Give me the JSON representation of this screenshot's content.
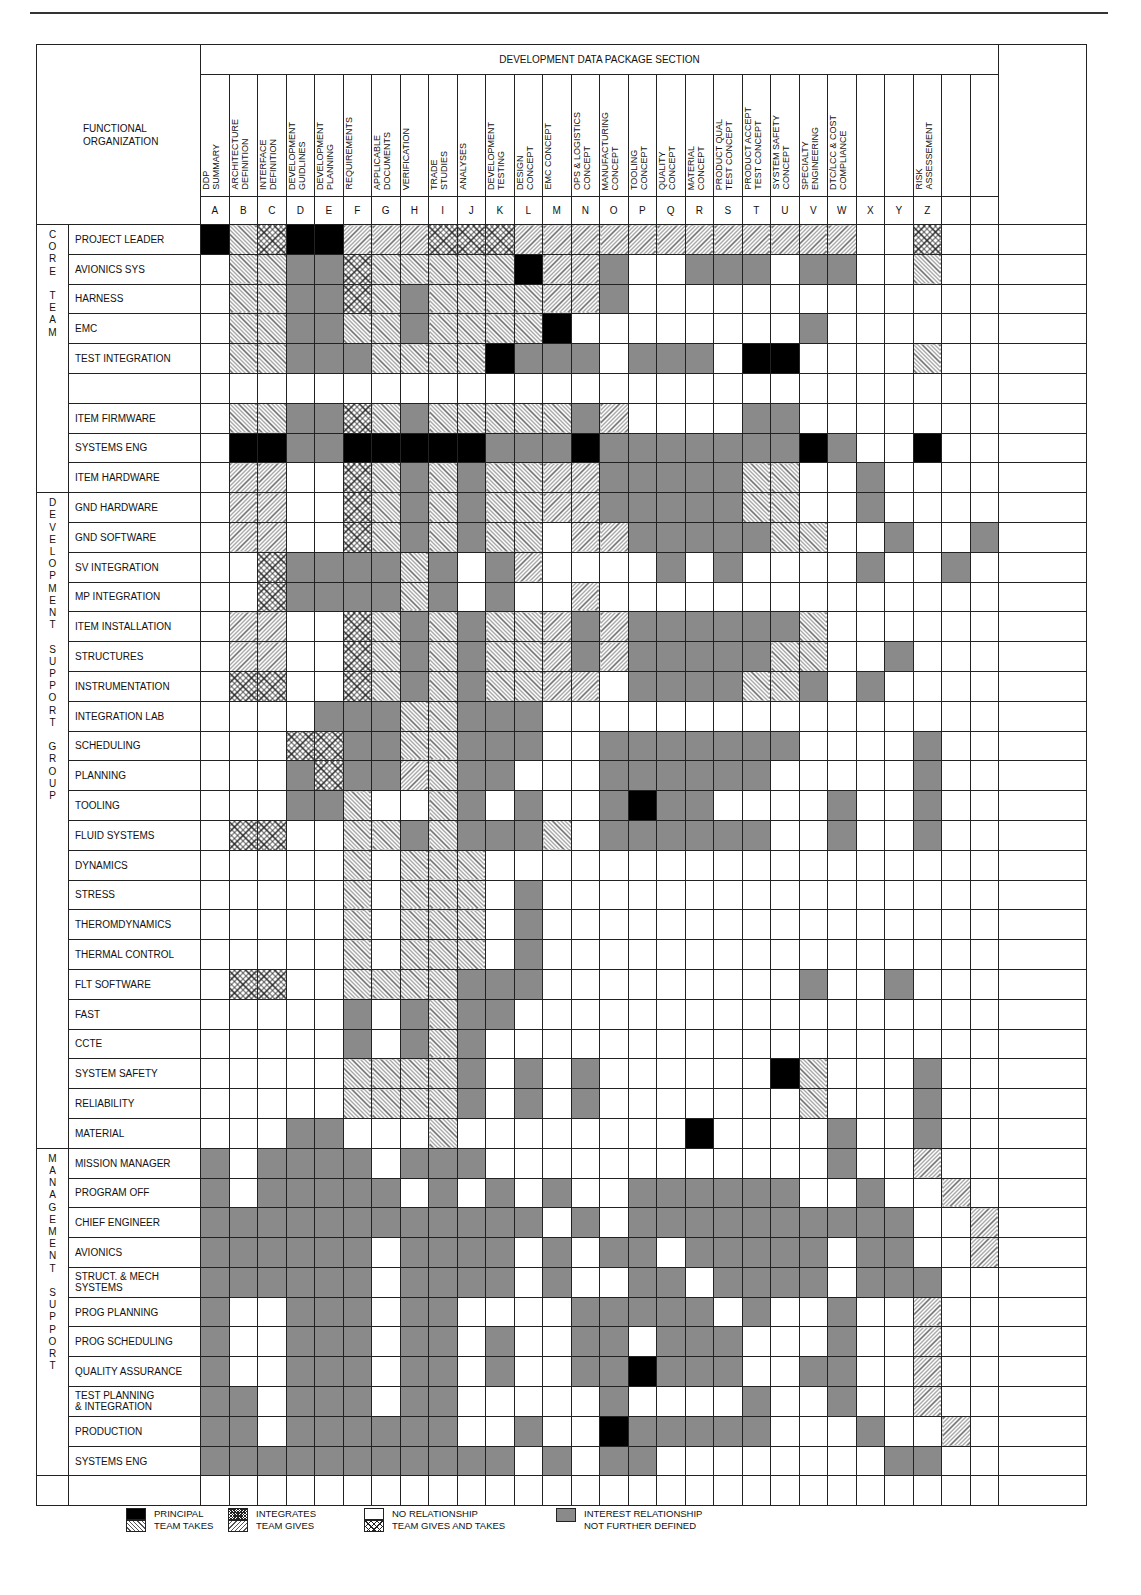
{
  "section_title": "DEVELOPMENT DATA PACKAGE SECTION",
  "functional_org_label": "FUNCTIONAL\nORGANIZATION",
  "columns": [
    {
      "letter": "A",
      "label": "DDP\nSUMMARY"
    },
    {
      "letter": "B",
      "label": "ARCHITECTURE\nDEFINITION"
    },
    {
      "letter": "C",
      "label": "INTERFACE\nDEFINITION"
    },
    {
      "letter": "D",
      "label": "DEVELOPMENT\nGUIDLINES"
    },
    {
      "letter": "E",
      "label": "DEVELOPMENT\nPLANNING"
    },
    {
      "letter": "F",
      "label": "REQUIREMENTS"
    },
    {
      "letter": "G",
      "label": "APPLICABLE\nDOCUMENTS"
    },
    {
      "letter": "H",
      "label": "VERIFICATION"
    },
    {
      "letter": "I",
      "label": "TRADE\nSTUDIES"
    },
    {
      "letter": "J",
      "label": "ANALYSES"
    },
    {
      "letter": "K",
      "label": "DEVELOPMENT\nTESTING"
    },
    {
      "letter": "L",
      "label": "DESIGN\nCONCEPT"
    },
    {
      "letter": "M",
      "label": "EMC CONCEPT"
    },
    {
      "letter": "N",
      "label": "OPS & LOGISTICS\nCONCEPT"
    },
    {
      "letter": "O",
      "label": "MANUFACTURING\nCONCEPT"
    },
    {
      "letter": "P",
      "label": "TOOLING\nCONCEPT"
    },
    {
      "letter": "Q",
      "label": "QUALITY\nCONCEPT"
    },
    {
      "letter": "R",
      "label": "MATERIAL\nCONCEPT"
    },
    {
      "letter": "S",
      "label": "PRODUCT QUAL\nTEST CONCEPT"
    },
    {
      "letter": "T",
      "label": "PRODUCT ACCEPT\nTEST CONCEPT"
    },
    {
      "letter": "U",
      "label": "SYSTEM SAFETY\nCONCEPT"
    },
    {
      "letter": "V",
      "label": "SPECIALTY\nENGINEERING"
    },
    {
      "letter": "W",
      "label": "DTC/LCC & COST\nCOMPLIANCE"
    },
    {
      "letter": "X",
      "label": ""
    },
    {
      "letter": "Y",
      "label": ""
    },
    {
      "letter": "Z",
      "label": "RISK\nASSESSEMENT"
    },
    {
      "letter": "",
      "label": ""
    },
    {
      "letter": "",
      "label": ""
    }
  ],
  "legend": {
    "P": {
      "label": "PRINCIPAL",
      "color": "#000000"
    },
    "T": {
      "label": "TEAM TAKES"
    },
    "INT": {
      "label": "INTEGRATES"
    },
    "G": {
      "label": "TEAM GIVES"
    },
    "N": {
      "label": "NO RELATIONSHIP"
    },
    "X": {
      "label": "TEAM GIVES AND TAKES"
    },
    "I": {
      "label": "INTEREST RELATIONSHIP\nNOT FURTHER DEFINED",
      "color": "#8a8a8a"
    }
  },
  "groups": [
    {
      "label": "C\nO\nR\nE\n\nT\nE\nA\nM",
      "rows": [
        {
          "name": "PROJECT LEADER",
          "cells": "PTXPPGGGXXXGGGGGGGGGGGG  X  "
        },
        {
          "name": "AVIONICS SYS",
          "cells": " TTIIXTTTTTPGGI  III II  T  "
        },
        {
          "name": "HARNESS",
          "cells": " TTIIXTITTTTGGI             "
        },
        {
          "name": "EMC",
          "cells": " TTIITTITTTTP        I      "
        },
        {
          "name": "TEST INTEGRATION",
          "cells": " TTIIITTTTPIII III PP    T  "
        },
        {
          "name": "",
          "cells": "                            "
        },
        {
          "name": "ITEM FIRMWARE",
          "cells": " TTIIXTITTTTTIG    II       "
        },
        {
          "name": "SYSTEMS ENG",
          "cells": " PPIIPPPPPIIIPIIIIIIIPI  P  "
        },
        {
          "name": "ITEM HARDWARE",
          "cells": " GG  XTITITTGGIIIIITT  I    "
        }
      ]
    },
    {
      "label": "D\nE\nV\nE\nL\nO\nP\nM\nE\nN\nT\n\nS\nU\nP\nP\nO\nR\nT\n\nG\nR\nO\nU\nP",
      "rows": [
        {
          "name": "GND HARDWARE",
          "cells": " GG  XTITITTGGIIIIITT  I    "
        },
        {
          "name": "GND SOFTWARE",
          "cells": " GG  XTITITT GGIIIIITT  I  I  "
        },
        {
          "name": "SV INTEGRATION",
          "cells": "  XIIIITI IG    I I    I  I  "
        },
        {
          "name": "MP INTEGRATION",
          "cells": "  XIIIITI I  G               "
        },
        {
          "name": "ITEM INSTALLATION",
          "cells": " GG  XTITITTGIGIIIIIIT      "
        },
        {
          "name": "STRUCTURES",
          "cells": " GG  XTITITTGIGIIIIITT  I   "
        },
        {
          "name": "INSTRUMENTATION",
          "cells": " XX  XTITITTGG IIIITTI I    "
        },
        {
          "name": "INTEGRATION LAB",
          "cells": "    IIITTIII                "
        },
        {
          "name": "SCHEDULING",
          "cells": "   XXIITTIII  IIIIIII    I  "
        },
        {
          "name": "PLANNING",
          "cells": "   IXIIGTII   IIIIII     I  "
        },
        {
          "name": "TOOLING",
          "cells": "   IIT  TI I  IPII    I  I  "
        },
        {
          "name": "FLUID SYSTEMS",
          "cells": " XX  TTITIIIT IIIIII  I  I  "
        },
        {
          "name": "DYNAMICS",
          "cells": "     T TTT                  "
        },
        {
          "name": "STRESS",
          "cells": "     T TTT I                "
        },
        {
          "name": "THEROMDYNAMICS",
          "cells": "     T TTT I                "
        },
        {
          "name": "THERMAL CONTROL",
          "cells": "     T TTT I                "
        },
        {
          "name": "FLT SOFTWARE",
          "cells": " XX  TTTTIII         I  I  "
        },
        {
          "name": "FAST",
          "cells": "     I ITII                 "
        },
        {
          "name": "CCTE",
          "cells": "     I ITI                  "
        },
        {
          "name": "SYSTEM SAFETY",
          "cells": "     TTTTI I I      PT   I  "
        },
        {
          "name": "RELIABILITY",
          "cells": "     TTTTI I I       T   I  "
        },
        {
          "name": "MATERIAL",
          "cells": "   II   T        P    I  I  "
        }
      ]
    },
    {
      "label": "M\nA\nN\nA\nG\nE\nM\nE\nN\nT\n\nS\nU\nP\nP\nO\nR\nT",
      "rows": [
        {
          "name": "MISSION MANAGER",
          "cells": "I IIII III            I  G  "
        },
        {
          "name": "PROGRAM OFF",
          "cells": "I IIIII I I I  IIIIII  I  G  "
        },
        {
          "name": "CHIEF ENGINEER",
          "cells": "IIIIIIIIIIII I IIIIIIIIII  G  "
        },
        {
          "name": "AVIONICS",
          "cells": "IIIIII IIII I II IIIII II  G  "
        },
        {
          "name": "STRUCT. & MECH\nSYSTEMS",
          "cells": "IIIIII IIII I  II IIII III  G  "
        },
        {
          "name": "PROG PLANNING",
          "cells": "I  III II    IIIII I  I  G  "
        },
        {
          "name": "PROG SCHEDULING",
          "cells": "I  III II I  II III   I  G  "
        },
        {
          "name": "QUALITY ASSURANCE",
          "cells": "I  III II I  IIPIII  II  G  "
        },
        {
          "name": "TEST PLANNING\n& INTEGRATION",
          "cells": "II III II     I    I  I  G  "
        },
        {
          "name": "PRODUCTION",
          "cells": "II IIIIII  I  PIIIII   I  G  "
        },
        {
          "name": "SYSTEMS ENG",
          "cells": "IIIIIIIIIII I II        II  G  "
        }
      ]
    }
  ],
  "trailing_blank_row": true
}
